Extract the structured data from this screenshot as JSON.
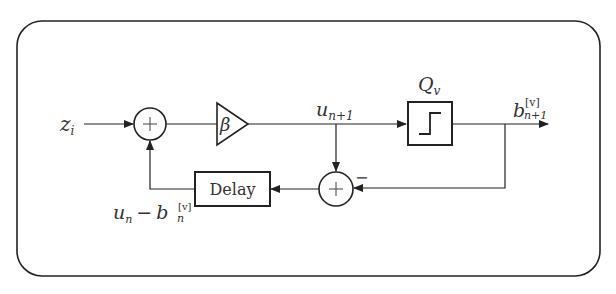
{
  "diagram": {
    "type": "block-diagram",
    "input_label": "z",
    "input_sub": "i",
    "gain_label": "β",
    "signal_label": "u",
    "signal_sub": "n+1",
    "quantizer_label": "Q",
    "quantizer_sub": "v",
    "output_label": "b",
    "output_sup": "[v]",
    "output_sub": "n+1",
    "delay_label": "Delay",
    "feedback_label_u": "u",
    "feedback_label_u_sub": "n",
    "feedback_minus": "−",
    "feedback_label_b": "b",
    "feedback_label_b_sup": "[v]",
    "feedback_label_b_sub": "n",
    "sum_symbol": "+",
    "negative_sign": "−"
  },
  "colors": {
    "stroke": "#222222",
    "text": "#333333",
    "background": "#ffffff"
  }
}
